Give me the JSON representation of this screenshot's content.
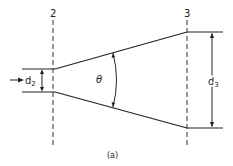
{
  "diagram": {
    "type": "diverging-nozzle",
    "section_labels": {
      "inlet": "2",
      "outlet": "3"
    },
    "dimension_labels": {
      "inlet_diameter": "d",
      "inlet_sub": "2",
      "outlet_diameter": "d",
      "outlet_sub": "3"
    },
    "angle_label": "θ",
    "caption": "(a)",
    "colors": {
      "line": "#222222",
      "background": "#ffffff"
    }
  }
}
